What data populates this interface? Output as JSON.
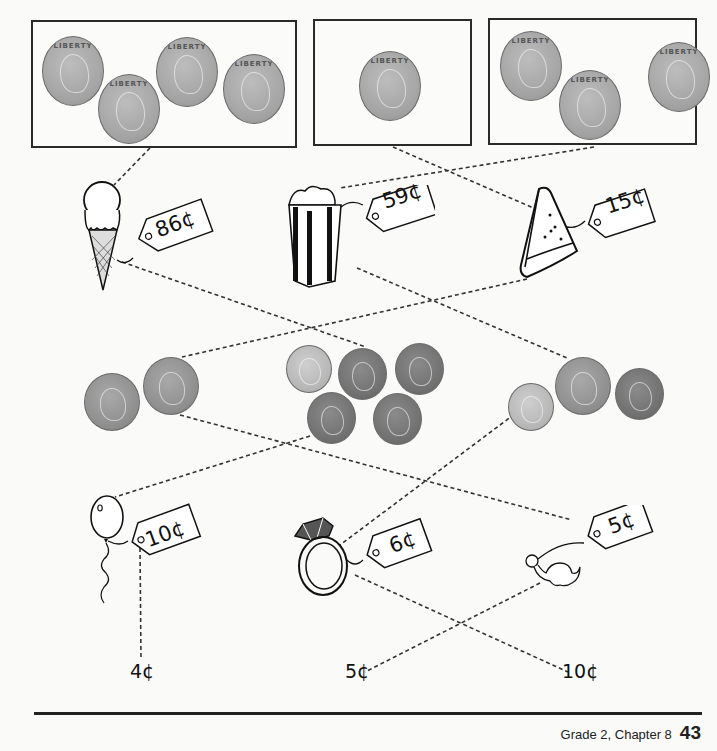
{
  "page": {
    "footer_text": "Grade 2, Chapter 8",
    "page_number": "43"
  },
  "coin_boxes": [
    {
      "label": "box-1",
      "coins": [
        "quarter",
        "quarter",
        "quarter",
        "quarter"
      ],
      "coin_text": "LIBERTY"
    },
    {
      "label": "box-2",
      "coins": [
        "quarter"
      ],
      "coin_text": "LIBERTY"
    },
    {
      "label": "box-3",
      "coins": [
        "quarter",
        "quarter",
        "quarter"
      ],
      "coin_text": "LIBERTY"
    }
  ],
  "items_row1": [
    {
      "name": "ice-cream-cone",
      "price": "86¢"
    },
    {
      "name": "popcorn",
      "price": "59¢"
    },
    {
      "name": "watermelon-slice",
      "price": "15¢"
    }
  ],
  "coin_groups": [
    {
      "label": "group-left",
      "coins": [
        "nickel",
        "nickel"
      ]
    },
    {
      "label": "group-middle",
      "coins": [
        "dime",
        "penny",
        "penny",
        "penny",
        "penny"
      ]
    },
    {
      "label": "group-right",
      "coins": [
        "dime",
        "nickel",
        "penny"
      ]
    }
  ],
  "items_row2": [
    {
      "name": "balloon",
      "price": "10¢"
    },
    {
      "name": "ring",
      "price": "6¢"
    },
    {
      "name": "toy-dinosaur",
      "price": "5¢"
    }
  ],
  "answers": [
    "4¢",
    "5¢",
    "10¢"
  ],
  "colors": {
    "line": "#333333",
    "ink": "#111111",
    "paper": "#fafaf8"
  }
}
